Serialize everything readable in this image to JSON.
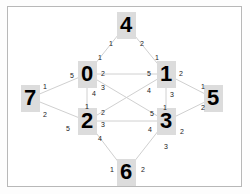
{
  "diagram": {
    "background_color": "#ffffff",
    "frame_color": "#b8b8b8",
    "node_fill": "#dcdcdc",
    "node_text_color": "#000000",
    "edge_color": "#d0d0d0",
    "nodes": [
      {
        "id": "n0",
        "label": "0",
        "x": 87,
        "y": 74
      },
      {
        "id": "n1",
        "label": "1",
        "x": 166,
        "y": 74
      },
      {
        "id": "n2",
        "label": "2",
        "x": 87,
        "y": 121
      },
      {
        "id": "n3",
        "label": "3",
        "x": 166,
        "y": 121
      },
      {
        "id": "n4",
        "label": "4",
        "x": 126,
        "y": 25
      },
      {
        "id": "n5",
        "label": "5",
        "x": 213,
        "y": 98
      },
      {
        "id": "n6",
        "label": "6",
        "x": 126,
        "y": 172
      },
      {
        "id": "n7",
        "label": "7",
        "x": 30,
        "y": 98
      }
    ],
    "edge_labels": [
      {
        "id": "l-4-left",
        "text": "1",
        "x": 109,
        "y": 40
      },
      {
        "id": "l-4-right",
        "text": "2",
        "x": 140,
        "y": 40
      },
      {
        "id": "l-0-up",
        "text": "1",
        "x": 98,
        "y": 54
      },
      {
        "id": "l-1-up",
        "text": "1",
        "x": 155,
        "y": 54
      },
      {
        "id": "l-0-left",
        "text": "5",
        "x": 70,
        "y": 72
      },
      {
        "id": "l-0-r2",
        "text": "2",
        "x": 101,
        "y": 70
      },
      {
        "id": "l-0-r3",
        "text": "3",
        "x": 101,
        "y": 84
      },
      {
        "id": "l-0-down4",
        "text": "4",
        "x": 92,
        "y": 90
      },
      {
        "id": "l-1-l5",
        "text": "5",
        "x": 147,
        "y": 70
      },
      {
        "id": "l-1-l4",
        "text": "4",
        "x": 147,
        "y": 87
      },
      {
        "id": "l-1-right2",
        "text": "2",
        "x": 179,
        "y": 70
      },
      {
        "id": "l-1-down3",
        "text": "3",
        "x": 170,
        "y": 91
      },
      {
        "id": "l-7-up",
        "text": "1",
        "x": 43,
        "y": 83
      },
      {
        "id": "l-7-down",
        "text": "2",
        "x": 43,
        "y": 111
      },
      {
        "id": "l-5-up",
        "text": "1",
        "x": 201,
        "y": 83
      },
      {
        "id": "l-5-down",
        "text": "2",
        "x": 201,
        "y": 104
      },
      {
        "id": "l-2-up1",
        "text": "1",
        "x": 85,
        "y": 103
      },
      {
        "id": "l-2-left5",
        "text": "5",
        "x": 66,
        "y": 125
      },
      {
        "id": "l-2-r2",
        "text": "2",
        "x": 101,
        "y": 109
      },
      {
        "id": "l-2-r3",
        "text": "3",
        "x": 101,
        "y": 121
      },
      {
        "id": "l-2-down4",
        "text": "4",
        "x": 98,
        "y": 135
      },
      {
        "id": "l-3-up1",
        "text": "1",
        "x": 163,
        "y": 104
      },
      {
        "id": "l-3-l5",
        "text": "5",
        "x": 150,
        "y": 110
      },
      {
        "id": "l-3-l4",
        "text": "4",
        "x": 148,
        "y": 126
      },
      {
        "id": "l-3-r2",
        "text": "2",
        "x": 180,
        "y": 128
      },
      {
        "id": "l-3-down3",
        "text": "3",
        "x": 164,
        "y": 143
      },
      {
        "id": "l-6-left",
        "text": "1",
        "x": 110,
        "y": 166
      },
      {
        "id": "l-6-right",
        "text": "2",
        "x": 141,
        "y": 166
      }
    ],
    "edges": [
      {
        "from": "n0",
        "to": "n4"
      },
      {
        "from": "n1",
        "to": "n4"
      },
      {
        "from": "n0",
        "to": "n1"
      },
      {
        "from": "n0",
        "to": "n7"
      },
      {
        "from": "n2",
        "to": "n7"
      },
      {
        "from": "n1",
        "to": "n5"
      },
      {
        "from": "n3",
        "to": "n5"
      },
      {
        "from": "n0",
        "to": "n2"
      },
      {
        "from": "n1",
        "to": "n3"
      },
      {
        "from": "n2",
        "to": "n3"
      },
      {
        "from": "n0",
        "to": "n3"
      },
      {
        "from": "n1",
        "to": "n2"
      },
      {
        "from": "n2",
        "to": "n6"
      },
      {
        "from": "n3",
        "to": "n6"
      }
    ]
  }
}
